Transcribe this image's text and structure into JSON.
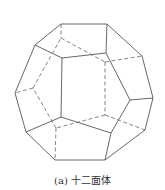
{
  "figure": {
    "caption": "(a) 十二面体",
    "line_color": "#555555",
    "vertices_solid": {
      "outer": [
        [
          61,
          24
        ],
        [
          107,
          24
        ],
        [
          142,
          56
        ],
        [
          153,
          98
        ],
        [
          145,
          130
        ],
        [
          105,
          160
        ],
        [
          55,
          160
        ],
        [
          26,
          132
        ],
        [
          15,
          93
        ],
        [
          35,
          45
        ]
      ],
      "front": [
        [
          62,
          58
        ],
        [
          106,
          53
        ],
        [
          130,
          100
        ],
        [
          111,
          133
        ],
        [
          61,
          117
        ]
      ]
    },
    "solid_edges": [
      [
        [
          61,
          24
        ],
        [
          107,
          24
        ]
      ],
      [
        [
          107,
          24
        ],
        [
          142,
          56
        ]
      ],
      [
        [
          142,
          56
        ],
        [
          153,
          98
        ]
      ],
      [
        [
          153,
          98
        ],
        [
          145,
          130
        ]
      ],
      [
        [
          145,
          130
        ],
        [
          105,
          160
        ]
      ],
      [
        [
          105,
          160
        ],
        [
          55,
          160
        ]
      ],
      [
        [
          55,
          160
        ],
        [
          26,
          132
        ]
      ],
      [
        [
          26,
          132
        ],
        [
          15,
          93
        ]
      ],
      [
        [
          15,
          93
        ],
        [
          35,
          45
        ]
      ],
      [
        [
          35,
          45
        ],
        [
          61,
          24
        ]
      ],
      [
        [
          62,
          58
        ],
        [
          106,
          53
        ]
      ],
      [
        [
          106,
          53
        ],
        [
          130,
          100
        ]
      ],
      [
        [
          130,
          100
        ],
        [
          111,
          133
        ]
      ],
      [
        [
          111,
          133
        ],
        [
          61,
          117
        ]
      ],
      [
        [
          61,
          117
        ],
        [
          62,
          58
        ]
      ],
      [
        [
          35,
          45
        ],
        [
          62,
          58
        ]
      ],
      [
        [
          107,
          24
        ],
        [
          106,
          53
        ]
      ],
      [
        [
          153,
          98
        ],
        [
          130,
          100
        ]
      ],
      [
        [
          105,
          160
        ],
        [
          111,
          133
        ]
      ],
      [
        [
          26,
          132
        ],
        [
          61,
          117
        ]
      ]
    ],
    "dashed_edges": [
      [
        [
          61,
          38
        ],
        [
          105,
          62
        ]
      ],
      [
        [
          105,
          62
        ],
        [
          105,
          115
        ]
      ],
      [
        [
          105,
          115
        ],
        [
          56,
          128
        ]
      ],
      [
        [
          56,
          128
        ],
        [
          33,
          88
        ]
      ],
      [
        [
          33,
          88
        ],
        [
          61,
          38
        ]
      ],
      [
        [
          61,
          24
        ],
        [
          61,
          38
        ]
      ],
      [
        [
          105,
          62
        ],
        [
          142,
          56
        ]
      ],
      [
        [
          105,
          115
        ],
        [
          145,
          130
        ]
      ],
      [
        [
          56,
          128
        ],
        [
          55,
          160
        ]
      ],
      [
        [
          33,
          88
        ],
        [
          15,
          93
        ]
      ]
    ]
  }
}
